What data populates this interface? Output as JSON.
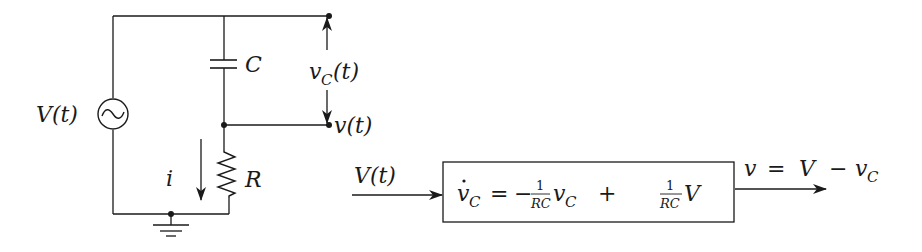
{
  "circuit": {
    "source_label": "V(t)",
    "capacitor_label": "C",
    "resistor_label": "R",
    "current_label": "i",
    "vc_label_main": "v",
    "vc_label_sub": "C",
    "vc_label_arg": "(t)",
    "output_label": "v(t)"
  },
  "block": {
    "input_label": "V(t)",
    "eq_lhs_var": "v",
    "eq_lhs_sub": "C",
    "eq_equals": "=",
    "eq_minus": "−",
    "frac1_num": "1",
    "frac1_den": "RC",
    "eq_term1_var": "v",
    "eq_term1_sub": "C",
    "eq_plus": "+",
    "frac2_num": "1",
    "frac2_den": "RC",
    "eq_term2_var": "V",
    "output_lhs": "v",
    "output_eq": "=",
    "output_V": "V",
    "output_minus": "−",
    "output_vc": "v",
    "output_vc_sub": "C"
  },
  "colors": {
    "ink": "#1a1a1a",
    "background": "#ffffff"
  }
}
